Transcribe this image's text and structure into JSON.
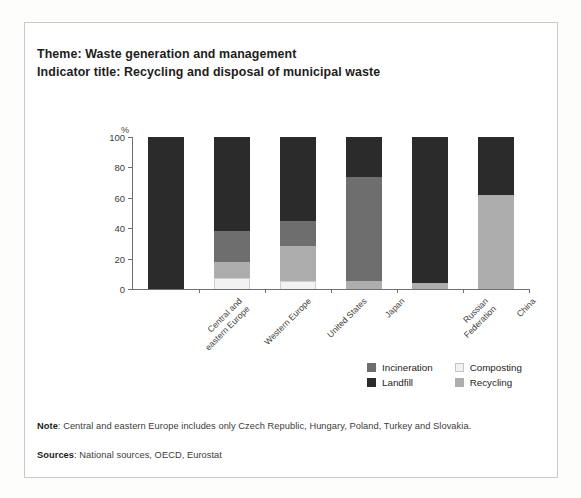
{
  "header": {
    "theme_line": "Theme: Waste generation and management",
    "indicator_line": "Indicator title: Recycling and disposal of municipal waste"
  },
  "footnotes": {
    "note_label": "Note",
    "note_text": ": Central and eastern Europe includes only Czech Republic, Hungary, Poland, Turkey and Slovakia.",
    "sources_label": "Sources",
    "sources_text": ": National sources, OECD, Eurostat"
  },
  "colors": {
    "incineration": "#6e6e6e",
    "landfill": "#2b2b2b",
    "composting": "#f2f2f2",
    "recycling": "#adadad",
    "axis": "#6f6f6f",
    "text": "#1d1d1b"
  },
  "chart_data": {
    "type": "bar",
    "stacked": true,
    "title": "Recycling and disposal of municipal waste",
    "xlabel": "",
    "ylabel": "%",
    "yunit": "%",
    "ylim": [
      0,
      100
    ],
    "yticks": [
      0,
      20,
      40,
      60,
      80,
      100
    ],
    "grid": false,
    "legend_position": "bottom-right",
    "categories": [
      "Central and eastern Europe",
      "Western Europe",
      "United States",
      "Japan",
      "Russian Federation",
      "China"
    ],
    "category_lines": [
      [
        "Central and",
        "eastern Europe"
      ],
      [
        "Western Europe"
      ],
      [
        "United States"
      ],
      [
        "Japan"
      ],
      [
        "Russian",
        "Federation"
      ],
      [
        "China"
      ]
    ],
    "series": [
      {
        "name": "Composting",
        "color": "#f2f2f2",
        "values": [
          0,
          7,
          5,
          0,
          0,
          0
        ]
      },
      {
        "name": "Recycling",
        "color": "#adadad",
        "values": [
          0,
          11,
          23,
          5,
          4,
          62
        ]
      },
      {
        "name": "Incineration",
        "color": "#6e6e6e",
        "values": [
          0,
          20,
          17,
          69,
          0,
          0
        ]
      },
      {
        "name": "Landfill",
        "color": "#2b2b2b",
        "values": [
          100,
          62,
          55,
          26,
          96,
          38
        ]
      }
    ],
    "legend": [
      {
        "label": "Incineration",
        "color": "#6e6e6e"
      },
      {
        "label": "Composting",
        "color": "#f2f2f2"
      },
      {
        "label": "Landfill",
        "color": "#2b2b2b"
      },
      {
        "label": "Recycling",
        "color": "#adadad"
      }
    ]
  }
}
